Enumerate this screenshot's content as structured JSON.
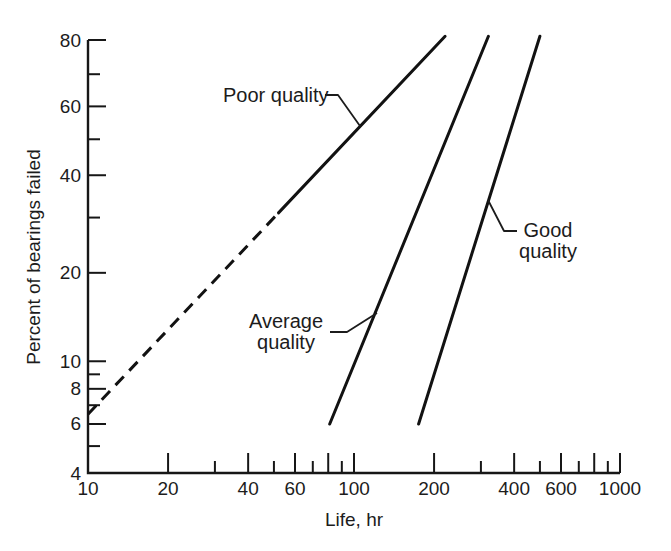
{
  "figure": {
    "background": "#ffffff",
    "ink_color": "#171717"
  },
  "chart_data": {
    "type": "line",
    "title": "",
    "x_axis": {
      "label": "Life, hr",
      "scale": "log10",
      "min": 10,
      "max": 1000,
      "labeled_ticks": [
        10,
        20,
        40,
        60,
        100,
        200,
        400,
        600,
        1000
      ],
      "major_ticks": [
        20,
        40,
        60,
        80,
        100,
        200,
        400,
        600,
        800,
        1000
      ],
      "minor_ticks": [
        30,
        50,
        70,
        90,
        300,
        500,
        700,
        900
      ]
    },
    "y_axis": {
      "label": "Percent of bearings failed",
      "scale": "weibull-probability",
      "min": 4,
      "max": 80,
      "labeled_ticks": [
        4,
        6,
        8,
        10,
        20,
        40,
        60,
        80
      ],
      "major_ticks": [
        6,
        8,
        10,
        20,
        40,
        60,
        80
      ],
      "minor_ticks": [
        5,
        7,
        9,
        30,
        50,
        70
      ]
    },
    "series": [
      {
        "name": "Poor quality",
        "segments": [
          {
            "style": "dashed",
            "points": [
              [
                10,
                6.5
              ],
              [
                52,
                31
              ]
            ]
          },
          {
            "style": "solid",
            "points": [
              [
                52,
                31
              ],
              [
                220,
                81
              ]
            ]
          }
        ]
      },
      {
        "name": "Average quality",
        "segments": [
          {
            "style": "solid",
            "points": [
              [
                81,
                6
              ],
              [
                320,
                81
              ]
            ]
          }
        ]
      },
      {
        "name": "Good quality",
        "segments": [
          {
            "style": "solid",
            "points": [
              [
                175,
                6
              ],
              [
                500,
                81
              ]
            ]
          }
        ]
      }
    ],
    "annotations": [
      {
        "id": "poor-quality",
        "lines": [
          "Poor quality"
        ],
        "align": "left",
        "text_px": [
          223,
          102
        ],
        "leader_px": [
          [
            325,
            95
          ],
          [
            338,
            95
          ],
          [
            360,
            126
          ]
        ]
      },
      {
        "id": "average-quality",
        "lines": [
          "Average",
          "quality"
        ],
        "align": "center",
        "text_px": [
          286,
          328
        ],
        "leader_px": [
          [
            330,
            332
          ],
          [
            347,
            332
          ],
          [
            377,
            313
          ]
        ]
      },
      {
        "id": "good-quality",
        "lines": [
          "Good",
          "quality"
        ],
        "align": "center",
        "text_px": [
          548,
          237
        ],
        "leader_px": [
          [
            488,
            200
          ],
          [
            504,
            231
          ],
          [
            517,
            231
          ]
        ]
      }
    ],
    "layout": {
      "grid": "off",
      "legend": "none",
      "x0_px": 88,
      "x1_px": 620,
      "y_top_px": 40,
      "y_bottom_px": 473,
      "y_major_tick_len": 18,
      "y_minor_tick_len": 12,
      "x_major_tick_len": 20,
      "x_minor_tick_len": 12,
      "annotation_line_height": 21
    }
  }
}
